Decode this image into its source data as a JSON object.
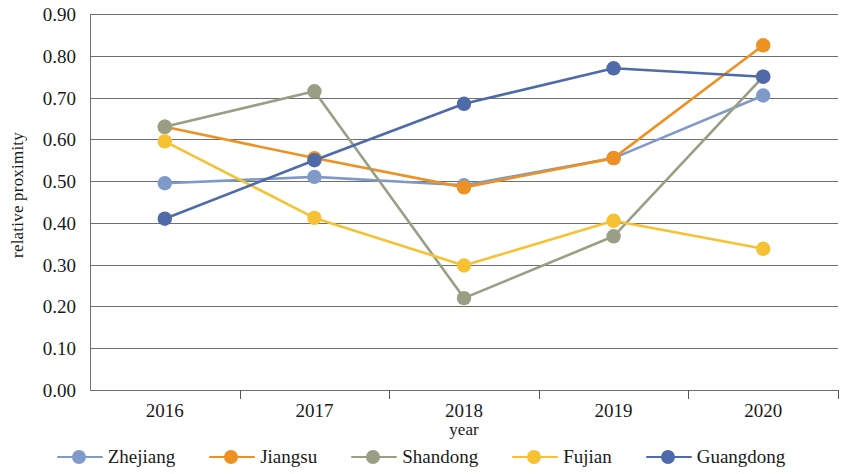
{
  "chart_data": {
    "type": "line",
    "title": "",
    "xlabel": "year",
    "ylabel": "relative proximity",
    "categories": [
      "2016",
      "2017",
      "2018",
      "2019",
      "2020"
    ],
    "x": [
      2016,
      2017,
      2018,
      2019,
      2020
    ],
    "ylim": [
      0.0,
      0.9
    ],
    "ytick_labels": [
      "0.00",
      "0.10",
      "0.20",
      "0.30",
      "0.40",
      "0.50",
      "0.60",
      "0.70",
      "0.80",
      "0.90"
    ],
    "ytick_values": [
      0.0,
      0.1,
      0.2,
      0.3,
      0.4,
      0.5,
      0.6,
      0.7,
      0.8,
      0.9
    ],
    "grid": true,
    "legend_position": "bottom",
    "series": [
      {
        "name": "Zhejiang",
        "color": "#7f9ac9",
        "values": [
          0.495,
          0.51,
          0.49,
          0.555,
          0.705
        ]
      },
      {
        "name": "Jiangsu",
        "color": "#ed9123",
        "values": [
          0.63,
          0.555,
          0.485,
          0.555,
          0.825
        ]
      },
      {
        "name": "Shandong",
        "color": "#9a9e85",
        "values": [
          0.63,
          0.715,
          0.22,
          0.368,
          0.75
        ]
      },
      {
        "name": "Fujian",
        "color": "#f6c233",
        "values": [
          0.595,
          0.412,
          0.298,
          0.405,
          0.338
        ]
      },
      {
        "name": "Guangdong",
        "color": "#4f6aa8",
        "values": [
          0.41,
          0.55,
          0.685,
          0.77,
          0.75
        ]
      }
    ]
  },
  "legend": {
    "items": [
      {
        "label": "Zhejiang"
      },
      {
        "label": "Jiangsu"
      },
      {
        "label": "Shandong"
      },
      {
        "label": "Fujian"
      },
      {
        "label": "Guangdong"
      }
    ]
  },
  "axes": {
    "y_title": "relative proximity",
    "x_title": "year"
  }
}
